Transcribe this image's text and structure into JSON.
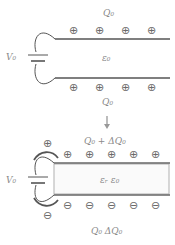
{
  "diagram": {
    "top": {
      "top_plate_label": "Q₀",
      "bottom_plate_label": "Q₀",
      "voltage_label": "V₀",
      "medium_label": "ε₀",
      "top_plate_charges": [
        "⊕",
        "⊕",
        "⊕",
        "⊕"
      ],
      "bottom_plate_charges": [
        "⊕",
        "⊕",
        "⊕",
        "⊕"
      ]
    },
    "arrow": "↓",
    "bottom": {
      "top_plate_label": "Q₀ + ΔQ₀",
      "bottom_plate_label": "Q₀   ΔQ₀",
      "voltage_label": "V₀",
      "medium_label": "εᵣ ε₀",
      "top_plate_charges": [
        "⊕",
        "⊕",
        "⊕",
        "⊕",
        "⊕"
      ],
      "bottom_plate_charges": [
        "⊖",
        "⊖",
        "⊖",
        "⊖",
        "⊖"
      ],
      "flow_top_charge": "⊕",
      "flow_bottom_charge": "⊖"
    },
    "colors": {
      "line": "#5a5a5a",
      "text": "#8a8a8a",
      "dielectric_border": "#b0b0b0"
    }
  }
}
